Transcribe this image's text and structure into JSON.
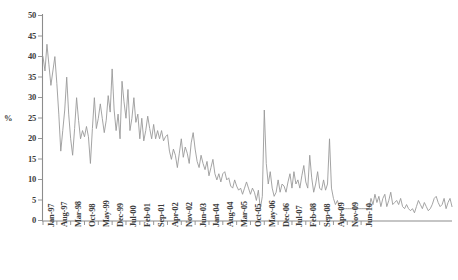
{
  "chart_data": {
    "type": "line",
    "title": "",
    "subtitle": "",
    "xlabel": "",
    "ylabel": "%",
    "ylim": [
      0,
      50
    ],
    "yticks": [
      0,
      5,
      10,
      15,
      20,
      25,
      30,
      35,
      40,
      45,
      50
    ],
    "grid": false,
    "legend": null,
    "legend_position": "none",
    "line_color": "#9a9a9a",
    "axis_color": "#8c8c8c",
    "x_tick_labels": [
      "Jan-97",
      "Aug-97",
      "Mar-98",
      "Oct-98",
      "May-99",
      "Dec-99",
      "Jul-00",
      "Feb-01",
      "Sep-01",
      "Apr-02",
      "Nov-02",
      "Jun-03",
      "Jan-04",
      "Aug-04",
      "Mar-05",
      "Oct-05",
      "May-06",
      "Dec-06",
      "Jul-07",
      "Feb-08",
      "Sep-08",
      "Apr-09",
      "Nov-09",
      "Jun-10"
    ],
    "x_tick_interval_months": 7,
    "x_start": "Jan-97",
    "x_end": "Aug-10",
    "series": [
      {
        "name": "percent",
        "values": [
          40.0,
          36.5,
          43.0,
          38.0,
          33.0,
          36.5,
          40.0,
          33.5,
          26.0,
          17.0,
          22.0,
          27.0,
          35.0,
          26.0,
          20.0,
          16.0,
          22.5,
          30.0,
          24.5,
          20.0,
          22.0,
          20.5,
          23.0,
          20.5,
          14.0,
          22.5,
          30.0,
          22.5,
          25.0,
          28.5,
          25.0,
          21.5,
          24.5,
          30.5,
          26.5,
          37.0,
          27.0,
          22.0,
          26.0,
          20.0,
          34.0,
          29.0,
          25.0,
          32.0,
          22.0,
          25.0,
          30.0,
          24.0,
          26.0,
          20.0,
          25.0,
          19.5,
          22.0,
          25.5,
          22.5,
          20.0,
          23.5,
          20.0,
          22.0,
          20.0,
          22.0,
          19.5,
          20.5,
          21.0,
          17.0,
          15.0,
          17.5,
          16.0,
          13.0,
          16.5,
          20.0,
          15.5,
          18.0,
          16.5,
          14.0,
          19.0,
          21.5,
          17.5,
          14.5,
          13.0,
          16.0,
          14.0,
          12.5,
          14.5,
          11.0,
          13.0,
          15.0,
          11.5,
          10.0,
          11.5,
          9.5,
          11.5,
          12.0,
          10.0,
          10.5,
          8.5,
          8.0,
          10.0,
          8.5,
          7.5,
          8.0,
          6.5,
          8.0,
          9.5,
          8.0,
          6.5,
          8.0,
          7.0,
          5.0,
          7.5,
          3.0,
          6.0,
          27.0,
          14.0,
          9.0,
          12.0,
          8.0,
          6.0,
          7.0,
          10.0,
          7.0,
          9.0,
          8.5,
          7.0,
          9.5,
          11.5,
          8.0,
          12.0,
          9.0,
          10.0,
          8.0,
          11.0,
          13.5,
          9.5,
          8.0,
          16.0,
          10.5,
          7.0,
          9.0,
          12.0,
          8.0,
          7.5,
          10.0,
          7.5,
          9.0,
          20.0,
          8.0,
          5.5,
          4.0,
          5.0,
          3.5,
          3.0,
          3.0,
          3.0,
          3.0,
          3.0,
          3.0,
          3.0,
          3.0,
          3.0,
          3.0,
          3.0,
          3.0,
          3.0,
          3.0,
          3.0,
          5.5,
          4.0,
          6.5,
          4.5,
          6.0,
          3.5,
          5.5,
          6.5,
          3.5,
          5.0,
          7.0,
          4.0,
          4.5,
          5.0,
          4.0,
          5.5,
          3.5,
          3.0,
          4.0,
          3.0,
          2.5,
          3.0,
          2.0,
          3.5,
          5.0,
          4.0,
          3.0,
          4.5,
          3.5,
          2.5,
          3.0,
          4.0,
          5.5,
          6.0,
          4.5,
          3.5,
          4.0,
          5.5,
          3.0,
          4.5,
          5.5,
          3.5
        ]
      }
    ]
  }
}
